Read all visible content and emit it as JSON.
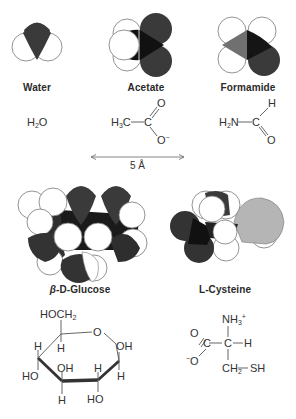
{
  "figure": {
    "scale_bar": {
      "label": "5 Å"
    },
    "colors": {
      "oxygen_dark": "#3a3a3a",
      "carbon_black": "#141414",
      "nitrogen_gray": "#6e6e6e",
      "sulfur_light": "#b8b8b8",
      "hydrogen_white": "#ffffff",
      "outline": "#777777"
    },
    "molecules": [
      {
        "id": "water",
        "name": "Water",
        "formula": {
          "H": "H",
          "sub": "2",
          "O": "O"
        }
      },
      {
        "id": "acetate",
        "name": "Acetate",
        "formula": {
          "methyl": "H",
          "methyl_sub": "3",
          "methyl_C": "C",
          "carbon": "C",
          "o_top": "O",
          "o_bottom": "O",
          "charge": "−"
        }
      },
      {
        "id": "formamide",
        "name": "Formamide",
        "formula": {
          "amine": "H",
          "amine_sub": "2",
          "amine_N": "N",
          "carbon": "C",
          "h_top": "H",
          "o_bottom": "O"
        }
      },
      {
        "id": "glucose",
        "name_prefix": "β",
        "name": "-D-Glucose",
        "formula": {
          "hoch2": "HOCH",
          "hoch2_sub": "2",
          "ring_o": "O",
          "labels": [
            "H",
            "H",
            "OH",
            "H",
            "HO",
            "OH",
            "H",
            "H",
            "HO",
            "H"
          ]
        }
      },
      {
        "id": "cysteine",
        "name": "L-Cysteine",
        "formula": {
          "nh3": "NH",
          "nh3_sub": "3",
          "nh3_charge": "+",
          "o_top": "O",
          "c_carboxyl": "C",
          "c_alpha": "C",
          "h": "H",
          "o_minus": "O",
          "o_minus_charge": "−",
          "ch2": "CH",
          "ch2_sub": "2",
          "sh": "SH"
        }
      }
    ]
  }
}
